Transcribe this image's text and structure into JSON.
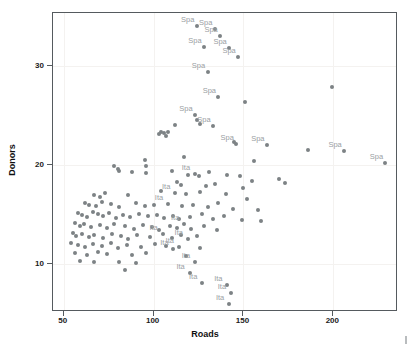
{
  "chart_data": {
    "type": "scatter",
    "title": "",
    "xlabel": "Roads",
    "ylabel": "Donors",
    "xlim": [
      44,
      236
    ],
    "ylim": [
      5.2,
      35.4
    ],
    "xticks": [
      50,
      100,
      150,
      200
    ],
    "yticks": [
      10,
      20,
      30
    ],
    "grid": true,
    "legend": "none",
    "point_color": "#7d8285",
    "label_color": "#9aa0a3",
    "axis_color": "#555a5e",
    "background": "#ffffff",
    "series": [
      {
        "name": "observations",
        "points": [
          {
            "x": 124,
            "y": 34.1,
            "label": "Spa"
          },
          {
            "x": 134,
            "y": 33.8,
            "label": "Spa"
          },
          {
            "x": 137,
            "y": 33.1,
            "label": "Spa"
          },
          {
            "x": 128,
            "y": 32.0,
            "label": "Spa"
          },
          {
            "x": 142,
            "y": 31.9,
            "label": "Spa"
          },
          {
            "x": 147,
            "y": 31.0,
            "label": "Spa"
          },
          {
            "x": 130,
            "y": 29.4,
            "label": "Spa"
          },
          {
            "x": 199,
            "y": 27.9,
            "label": null
          },
          {
            "x": 136,
            "y": 26.9,
            "label": "Spa"
          },
          {
            "x": 151,
            "y": 26.4,
            "label": null
          },
          {
            "x": 123,
            "y": 25.1,
            "label": "Spa"
          },
          {
            "x": 124,
            "y": 24.6,
            "label": null
          },
          {
            "x": 126,
            "y": 24.2,
            "label": null
          },
          {
            "x": 133,
            "y": 24.0,
            "label": "Spa"
          },
          {
            "x": 112,
            "y": 24.1,
            "label": null
          },
          {
            "x": 104,
            "y": 23.4,
            "label": null
          },
          {
            "x": 106,
            "y": 23.3,
            "label": null
          },
          {
            "x": 108,
            "y": 23.4,
            "label": null
          },
          {
            "x": 103,
            "y": 23.2,
            "label": null
          },
          {
            "x": 107,
            "y": 23.0,
            "label": null
          },
          {
            "x": 145,
            "y": 22.4,
            "label": null
          },
          {
            "x": 146,
            "y": 22.2,
            "label": "Spa"
          },
          {
            "x": 163,
            "y": 22.1,
            "label": "Spa"
          },
          {
            "x": 186,
            "y": 21.6,
            "label": null
          },
          {
            "x": 206,
            "y": 21.5,
            "label": "Spa"
          },
          {
            "x": 229,
            "y": 20.3,
            "label": "Spa"
          },
          {
            "x": 156,
            "y": 20.5,
            "label": null
          },
          {
            "x": 117,
            "y": 20.9,
            "label": null
          },
          {
            "x": 95,
            "y": 20.6,
            "label": null
          },
          {
            "x": 96,
            "y": 19.9,
            "label": null
          },
          {
            "x": 78,
            "y": 19.9,
            "label": null
          },
          {
            "x": 80,
            "y": 19.6,
            "label": null
          },
          {
            "x": 81,
            "y": 19.4,
            "label": null
          },
          {
            "x": 88,
            "y": 19.3,
            "label": null
          },
          {
            "x": 96,
            "y": 19.2,
            "label": null
          },
          {
            "x": 110,
            "y": 19.4,
            "label": null
          },
          {
            "x": 119,
            "y": 19.0,
            "label": null
          },
          {
            "x": 123,
            "y": 19.1,
            "label": "Ita"
          },
          {
            "x": 125,
            "y": 18.9,
            "label": null
          },
          {
            "x": 131,
            "y": 19.3,
            "label": null
          },
          {
            "x": 141,
            "y": 19.0,
            "label": null
          },
          {
            "x": 148,
            "y": 18.9,
            "label": null
          },
          {
            "x": 155,
            "y": 18.4,
            "label": null
          },
          {
            "x": 170,
            "y": 18.6,
            "label": null
          },
          {
            "x": 173,
            "y": 18.2,
            "label": null
          },
          {
            "x": 113,
            "y": 18.3,
            "label": null
          },
          {
            "x": 115,
            "y": 18.0,
            "label": null
          },
          {
            "x": 129,
            "y": 17.9,
            "label": null
          },
          {
            "x": 134,
            "y": 18.1,
            "label": null
          },
          {
            "x": 150,
            "y": 17.7,
            "label": null
          },
          {
            "x": 67,
            "y": 17.0,
            "label": null
          },
          {
            "x": 70,
            "y": 16.8,
            "label": null
          },
          {
            "x": 73,
            "y": 17.2,
            "label": null
          },
          {
            "x": 86,
            "y": 17.0,
            "label": null
          },
          {
            "x": 104,
            "y": 17.4,
            "label": null
          },
          {
            "x": 112,
            "y": 17.2,
            "label": "Ita"
          },
          {
            "x": 118,
            "y": 17.1,
            "label": null
          },
          {
            "x": 126,
            "y": 17.3,
            "label": null
          },
          {
            "x": 140,
            "y": 17.1,
            "label": null
          },
          {
            "x": 152,
            "y": 16.6,
            "label": null
          },
          {
            "x": 62,
            "y": 16.2,
            "label": null
          },
          {
            "x": 64,
            "y": 16.0,
            "label": null
          },
          {
            "x": 68,
            "y": 15.9,
            "label": null
          },
          {
            "x": 71,
            "y": 16.3,
            "label": null
          },
          {
            "x": 76,
            "y": 16.1,
            "label": null
          },
          {
            "x": 81,
            "y": 15.8,
            "label": null
          },
          {
            "x": 90,
            "y": 16.2,
            "label": null
          },
          {
            "x": 95,
            "y": 15.9,
            "label": null
          },
          {
            "x": 100,
            "y": 16.0,
            "label": null
          },
          {
            "x": 108,
            "y": 16.1,
            "label": "Ita"
          },
          {
            "x": 116,
            "y": 15.9,
            "label": null
          },
          {
            "x": 122,
            "y": 16.0,
            "label": null
          },
          {
            "x": 130,
            "y": 15.8,
            "label": null
          },
          {
            "x": 136,
            "y": 16.2,
            "label": null
          },
          {
            "x": 144,
            "y": 15.6,
            "label": null
          },
          {
            "x": 158,
            "y": 15.5,
            "label": null
          },
          {
            "x": 58,
            "y": 15.2,
            "label": null
          },
          {
            "x": 60,
            "y": 15.0,
            "label": null
          },
          {
            "x": 63,
            "y": 14.8,
            "label": null
          },
          {
            "x": 66,
            "y": 15.3,
            "label": null
          },
          {
            "x": 69,
            "y": 15.1,
            "label": null
          },
          {
            "x": 72,
            "y": 14.9,
            "label": null
          },
          {
            "x": 75,
            "y": 15.2,
            "label": null
          },
          {
            "x": 79,
            "y": 14.7,
            "label": null
          },
          {
            "x": 83,
            "y": 15.0,
            "label": null
          },
          {
            "x": 87,
            "y": 14.8,
            "label": null
          },
          {
            "x": 92,
            "y": 15.1,
            "label": null
          },
          {
            "x": 97,
            "y": 14.9,
            "label": null
          },
          {
            "x": 102,
            "y": 15.0,
            "label": null
          },
          {
            "x": 106,
            "y": 14.7,
            "label": null
          },
          {
            "x": 111,
            "y": 14.9,
            "label": null
          },
          {
            "x": 114,
            "y": 14.6,
            "label": null
          },
          {
            "x": 120,
            "y": 14.8,
            "label": null
          },
          {
            "x": 127,
            "y": 15.1,
            "label": null
          },
          {
            "x": 133,
            "y": 14.6,
            "label": null
          },
          {
            "x": 139,
            "y": 14.9,
            "label": null
          },
          {
            "x": 149,
            "y": 14.5,
            "label": null
          },
          {
            "x": 160,
            "y": 14.4,
            "label": null
          },
          {
            "x": 56,
            "y": 14.2,
            "label": null
          },
          {
            "x": 59,
            "y": 13.9,
            "label": null
          },
          {
            "x": 61,
            "y": 14.1,
            "label": null
          },
          {
            "x": 65,
            "y": 13.8,
            "label": null
          },
          {
            "x": 70,
            "y": 14.0,
            "label": null
          },
          {
            "x": 74,
            "y": 13.7,
            "label": null
          },
          {
            "x": 78,
            "y": 14.1,
            "label": null
          },
          {
            "x": 84,
            "y": 13.9,
            "label": null
          },
          {
            "x": 89,
            "y": 13.6,
            "label": null
          },
          {
            "x": 94,
            "y": 14.0,
            "label": null
          },
          {
            "x": 99,
            "y": 13.8,
            "label": null
          },
          {
            "x": 103,
            "y": 13.5,
            "label": null
          },
          {
            "x": 109,
            "y": 13.9,
            "label": null
          },
          {
            "x": 113,
            "y": 13.7,
            "label": null
          },
          {
            "x": 117,
            "y": 14.1,
            "label": "Ita"
          },
          {
            "x": 121,
            "y": 13.6,
            "label": null
          },
          {
            "x": 128,
            "y": 13.9,
            "label": null
          },
          {
            "x": 135,
            "y": 13.5,
            "label": null
          },
          {
            "x": 55,
            "y": 13.2,
            "label": null
          },
          {
            "x": 57,
            "y": 12.9,
            "label": null
          },
          {
            "x": 60,
            "y": 13.1,
            "label": null
          },
          {
            "x": 64,
            "y": 12.8,
            "label": null
          },
          {
            "x": 67,
            "y": 13.0,
            "label": null
          },
          {
            "x": 72,
            "y": 12.7,
            "label": null
          },
          {
            "x": 77,
            "y": 13.1,
            "label": null
          },
          {
            "x": 82,
            "y": 12.9,
            "label": null
          },
          {
            "x": 86,
            "y": 12.6,
            "label": null
          },
          {
            "x": 91,
            "y": 13.0,
            "label": null
          },
          {
            "x": 98,
            "y": 12.8,
            "label": null
          },
          {
            "x": 105,
            "y": 13.1,
            "label": "Ita"
          },
          {
            "x": 110,
            "y": 12.7,
            "label": null
          },
          {
            "x": 115,
            "y": 13.0,
            "label": null
          },
          {
            "x": 119,
            "y": 12.6,
            "label": "Ita"
          },
          {
            "x": 124,
            "y": 12.9,
            "label": null
          },
          {
            "x": 54,
            "y": 12.2,
            "label": null
          },
          {
            "x": 58,
            "y": 12.0,
            "label": null
          },
          {
            "x": 62,
            "y": 11.8,
            "label": null
          },
          {
            "x": 66,
            "y": 12.1,
            "label": null
          },
          {
            "x": 71,
            "y": 11.9,
            "label": null
          },
          {
            "x": 76,
            "y": 12.2,
            "label": null
          },
          {
            "x": 80,
            "y": 11.7,
            "label": null
          },
          {
            "x": 85,
            "y": 12.0,
            "label": null
          },
          {
            "x": 93,
            "y": 11.8,
            "label": null
          },
          {
            "x": 101,
            "y": 12.1,
            "label": null
          },
          {
            "x": 107,
            "y": 11.9,
            "label": null
          },
          {
            "x": 111,
            "y": 11.6,
            "label": "Ita"
          },
          {
            "x": 114,
            "y": 11.8,
            "label": "Ita"
          },
          {
            "x": 126,
            "y": 11.7,
            "label": null
          },
          {
            "x": 56,
            "y": 11.2,
            "label": null
          },
          {
            "x": 63,
            "y": 11.0,
            "label": null
          },
          {
            "x": 69,
            "y": 11.3,
            "label": null
          },
          {
            "x": 74,
            "y": 11.1,
            "label": null
          },
          {
            "x": 88,
            "y": 11.0,
            "label": null
          },
          {
            "x": 96,
            "y": 11.2,
            "label": null
          },
          {
            "x": 118,
            "y": 10.9,
            "label": null
          },
          {
            "x": 59,
            "y": 10.4,
            "label": null
          },
          {
            "x": 67,
            "y": 10.2,
            "label": null
          },
          {
            "x": 81,
            "y": 10.3,
            "label": null
          },
          {
            "x": 90,
            "y": 10.1,
            "label": null
          },
          {
            "x": 123,
            "y": 10.3,
            "label": "Ita"
          },
          {
            "x": 84,
            "y": 9.4,
            "label": null
          },
          {
            "x": 120,
            "y": 9.1,
            "label": "Ita"
          },
          {
            "x": 127,
            "y": 8.1,
            "label": "Ita"
          },
          {
            "x": 141,
            "y": 7.9,
            "label": "Ita"
          },
          {
            "x": 143,
            "y": 7.1,
            "label": "Ita"
          },
          {
            "x": 142,
            "y": 6.0,
            "label": "Ita"
          }
        ]
      }
    ]
  }
}
